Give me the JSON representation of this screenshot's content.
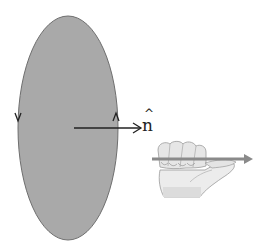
{
  "diagram": {
    "loop": {
      "fill": "#a9a9a9",
      "stroke": "#6e6e6e",
      "circulation_marks": [
        "down-arrowhead-left",
        "up-arrowhead-right"
      ]
    },
    "normal_vector": {
      "label": "n",
      "hat": "^",
      "color": "#222222"
    },
    "hand": {
      "skin": "#e8e8e8",
      "outline": "#9a9a9a",
      "rod_color": "#8a8a8a"
    }
  }
}
